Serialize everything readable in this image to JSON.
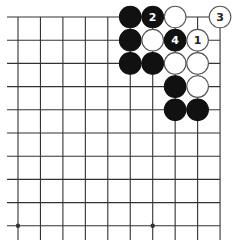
{
  "diagram": {
    "type": "go-board-fragment",
    "visible_columns": 10,
    "visible_rows": 10,
    "edges": {
      "top": true,
      "right": true,
      "left": false,
      "bottom": false
    },
    "star_points": [
      {
        "col": 0,
        "row": 9
      },
      {
        "col": 6,
        "row": 9
      }
    ],
    "stones": [
      {
        "col": 5,
        "row": 0,
        "color": "black",
        "label": ""
      },
      {
        "col": 6,
        "row": 0,
        "color": "black",
        "label": "2"
      },
      {
        "col": 7,
        "row": 0,
        "color": "white",
        "label": ""
      },
      {
        "col": 9,
        "row": 0,
        "color": "white",
        "label": "3"
      },
      {
        "col": 5,
        "row": 1,
        "color": "black",
        "label": ""
      },
      {
        "col": 6,
        "row": 1,
        "color": "white",
        "label": ""
      },
      {
        "col": 7,
        "row": 1,
        "color": "black",
        "label": "4"
      },
      {
        "col": 8,
        "row": 1,
        "color": "white",
        "label": "1"
      },
      {
        "col": 5,
        "row": 2,
        "color": "black",
        "label": ""
      },
      {
        "col": 6,
        "row": 2,
        "color": "black",
        "label": ""
      },
      {
        "col": 7,
        "row": 2,
        "color": "white",
        "label": ""
      },
      {
        "col": 8,
        "row": 2,
        "color": "white",
        "label": ""
      },
      {
        "col": 7,
        "row": 3,
        "color": "black",
        "label": ""
      },
      {
        "col": 8,
        "row": 3,
        "color": "white",
        "label": ""
      },
      {
        "col": 7,
        "row": 4,
        "color": "black",
        "label": ""
      },
      {
        "col": 8,
        "row": 4,
        "color": "black",
        "label": ""
      }
    ],
    "colors": {
      "line": "#333333",
      "black_stone": "#111111",
      "white_stone_fill": "#ffffff",
      "white_stone_stroke": "#555555",
      "label_on_black": "#ffffff",
      "label_on_white": "#222222"
    }
  }
}
